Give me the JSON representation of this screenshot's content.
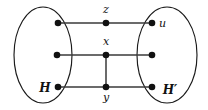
{
  "figure": {
    "type": "graph-diagram",
    "background_color": "#ffffff",
    "stroke_color": "#1a1a1a",
    "edge_color": "#3a3a3a",
    "vertex_color": "#111111",
    "width": 208,
    "height": 110
  },
  "groups": [
    {
      "id": "H",
      "label": "H",
      "cx": 43,
      "cy": 55,
      "rx": 29,
      "ry": 48,
      "label_x": 45,
      "label_y": 92
    },
    {
      "id": "Hprime",
      "label": "H′",
      "cx": 167,
      "cy": 55,
      "rx": 30,
      "ry": 48,
      "label_x": 170,
      "label_y": 94
    }
  ],
  "vertices": [
    {
      "id": "h1",
      "label": "",
      "x": 58,
      "y": 23,
      "r": 3.3,
      "label_x": 0,
      "label_y": 0,
      "anchor": "middle"
    },
    {
      "id": "h2",
      "label": "",
      "x": 57,
      "y": 55,
      "r": 3.3,
      "label_x": 0,
      "label_y": 0,
      "anchor": "middle"
    },
    {
      "id": "h3",
      "label": "",
      "x": 58,
      "y": 87,
      "r": 3.3,
      "label_x": 0,
      "label_y": 0,
      "anchor": "middle"
    },
    {
      "id": "z",
      "label": "z",
      "x": 106,
      "y": 23,
      "r": 3.3,
      "label_x": 106,
      "label_y": 13,
      "anchor": "middle"
    },
    {
      "id": "x",
      "label": "x",
      "x": 106,
      "y": 55,
      "r": 3.3,
      "label_x": 106,
      "label_y": 45,
      "anchor": "middle"
    },
    {
      "id": "y",
      "label": "y",
      "x": 106,
      "y": 87,
      "r": 3.3,
      "label_x": 106,
      "label_y": 101,
      "anchor": "middle"
    },
    {
      "id": "u",
      "label": "u",
      "x": 152,
      "y": 23,
      "r": 3.3,
      "label_x": 159,
      "label_y": 27,
      "anchor": "start"
    },
    {
      "id": "hp2",
      "label": "",
      "x": 152,
      "y": 55,
      "r": 3.3,
      "label_x": 0,
      "label_y": 0,
      "anchor": "middle"
    },
    {
      "id": "hp3",
      "label": "",
      "x": 152,
      "y": 87,
      "r": 3.3,
      "label_x": 0,
      "label_y": 0,
      "anchor": "middle"
    }
  ],
  "edges": [
    {
      "id": "e-h1-z",
      "from": "h1",
      "to": "z",
      "x1": 58,
      "y1": 23,
      "x2": 106,
      "y2": 23
    },
    {
      "id": "e-z-u",
      "from": "z",
      "to": "u",
      "x1": 106,
      "y1": 23,
      "x2": 152,
      "y2": 23
    },
    {
      "id": "e-h2-x",
      "from": "h2",
      "to": "x",
      "x1": 57,
      "y1": 55,
      "x2": 106,
      "y2": 55
    },
    {
      "id": "e-x-hp2",
      "from": "x",
      "to": "hp2",
      "x1": 106,
      "y1": 55,
      "x2": 152,
      "y2": 55
    },
    {
      "id": "e-h3-y",
      "from": "h3",
      "to": "y",
      "x1": 58,
      "y1": 87,
      "x2": 106,
      "y2": 87
    },
    {
      "id": "e-y-hp3",
      "from": "y",
      "to": "hp3",
      "x1": 106,
      "y1": 87,
      "x2": 152,
      "y2": 87
    },
    {
      "id": "e-x-y",
      "from": "x",
      "to": "y",
      "x1": 106,
      "y1": 55,
      "x2": 106,
      "y2": 87
    }
  ]
}
